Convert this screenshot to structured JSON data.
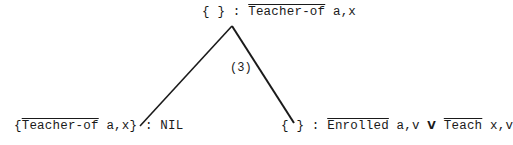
{
  "root": {
    "set": "{ }",
    "sep": ":",
    "literal": "Teacher-of",
    "args": "a,x"
  },
  "left_child": {
    "set_open": "{",
    "literal": "Teacher-of",
    "args": "a,x",
    "set_close": "}",
    "sep": ":",
    "clause": "NIL"
  },
  "right_child": {
    "set": "{ }",
    "sep": ":",
    "literal1": "Enrolled",
    "args1": "a,v",
    "connective": "V",
    "literal2": "Teach",
    "args2": "x,v"
  },
  "edge_label": "(3)",
  "colors": {
    "ink": "#1a1a1a",
    "background": "#ffffff"
  }
}
